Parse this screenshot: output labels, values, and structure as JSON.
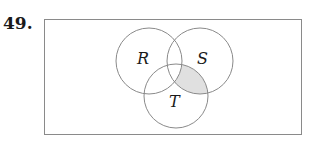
{
  "problem": {
    "number": "49."
  },
  "venn": {
    "sets": [
      {
        "name": "R",
        "cx": 149,
        "cy": 61,
        "r": 33
      },
      {
        "name": "S",
        "cx": 200,
        "cy": 61,
        "r": 33
      },
      {
        "name": "T",
        "cx": 176,
        "cy": 96,
        "r": 32
      }
    ],
    "shaded_region": "S ∩ T ∩ R'",
    "colors": {
      "outline": "#8a8a8a",
      "shade": "#e0e0e0",
      "frame": "#8a8a8a"
    }
  }
}
